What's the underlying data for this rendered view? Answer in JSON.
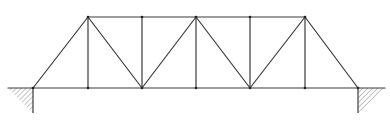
{
  "diagram": {
    "type": "pratt-truss",
    "title": "",
    "colors": {
      "member": "#3a3a3a",
      "hatch": "#6a6a6a",
      "background": "#ffffff"
    },
    "nodes": {
      "bottom": [
        {
          "id": "B0",
          "x": 33,
          "y": 88
        },
        {
          "id": "B1",
          "x": 88,
          "y": 88
        },
        {
          "id": "B2",
          "x": 142,
          "y": 88
        },
        {
          "id": "B3",
          "x": 196,
          "y": 88
        },
        {
          "id": "B4",
          "x": 250,
          "y": 88
        },
        {
          "id": "B5",
          "x": 305,
          "y": 88
        },
        {
          "id": "B6",
          "x": 358,
          "y": 88
        }
      ],
      "top": [
        {
          "id": "T1",
          "x": 88,
          "y": 17
        },
        {
          "id": "T2",
          "x": 142,
          "y": 17
        },
        {
          "id": "T3",
          "x": 196,
          "y": 17
        },
        {
          "id": "T4",
          "x": 250,
          "y": 17
        },
        {
          "id": "T5",
          "x": 305,
          "y": 17
        }
      ]
    },
    "members": [
      {
        "name": "bottom-chord",
        "from": [
          8,
          88
        ],
        "to": [
          385,
          88
        ]
      },
      {
        "name": "top-chord",
        "from": [
          88,
          17
        ],
        "to": [
          305,
          17
        ]
      },
      {
        "name": "left-end-post",
        "from": [
          33,
          88
        ],
        "to": [
          88,
          17
        ]
      },
      {
        "name": "right-end-post",
        "from": [
          358,
          88
        ],
        "to": [
          305,
          17
        ]
      },
      {
        "name": "vertical-1",
        "from": [
          88,
          17
        ],
        "to": [
          88,
          88
        ]
      },
      {
        "name": "vertical-2",
        "from": [
          142,
          17
        ],
        "to": [
          142,
          88
        ]
      },
      {
        "name": "vertical-3",
        "from": [
          196,
          17
        ],
        "to": [
          196,
          88
        ]
      },
      {
        "name": "vertical-4",
        "from": [
          250,
          17
        ],
        "to": [
          250,
          88
        ]
      },
      {
        "name": "vertical-5",
        "from": [
          305,
          17
        ],
        "to": [
          305,
          88
        ]
      },
      {
        "name": "diagonal-1",
        "from": [
          88,
          17
        ],
        "to": [
          142,
          88
        ]
      },
      {
        "name": "diagonal-2",
        "from": [
          142,
          88
        ],
        "to": [
          196,
          17
        ]
      },
      {
        "name": "diagonal-3",
        "from": [
          196,
          17
        ],
        "to": [
          250,
          88
        ]
      },
      {
        "name": "diagonal-4",
        "from": [
          250,
          88
        ],
        "to": [
          305,
          17
        ]
      }
    ],
    "supports": [
      {
        "name": "left-support",
        "side": "left",
        "node": "B0",
        "triangle": [
          [
            8,
            88
          ],
          [
            33,
            88
          ],
          [
            33,
            113
          ]
        ]
      },
      {
        "name": "right-support",
        "side": "right",
        "node": "B6",
        "triangle": [
          [
            358,
            88
          ],
          [
            387,
            88
          ],
          [
            358,
            113
          ]
        ]
      }
    ]
  }
}
